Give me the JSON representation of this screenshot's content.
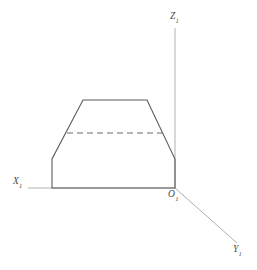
{
  "figure": {
    "canvas": {
      "width": 257,
      "height": 270
    },
    "background_color": "#ffffff",
    "axis_color": "#b0b0b0",
    "outline_color": "#5a5a5a",
    "dashed_color": "#6a6a6a"
  },
  "axes": {
    "z": {
      "name": "z-axis",
      "label_letter": "Z",
      "label_subscript": "1",
      "from": [
        175,
        188
      ],
      "to": [
        175,
        28
      ]
    },
    "x": {
      "name": "x-axis",
      "label_letter": "X",
      "label_subscript": "1",
      "from": [
        175,
        188
      ],
      "to": [
        28,
        188
      ]
    },
    "y": {
      "name": "y-axis",
      "label_letter": "Y",
      "label_subscript": "1",
      "from": [
        175,
        188
      ],
      "to": [
        237,
        243
      ]
    },
    "origin": {
      "name": "origin",
      "label_letter": "O",
      "label_subscript": "1",
      "point": [
        175,
        188
      ]
    }
  },
  "shapes": {
    "trapezoid_outline": {
      "name": "trapezoid-cross-section",
      "points": "52,188 52,159 83,100 147,100 175,159 175,188",
      "closed": true,
      "stroke": "#5a5a5a",
      "fill": "none"
    },
    "dashed_chord": {
      "name": "dashed-horizontal-chord",
      "from": [
        67,
        133
      ],
      "to": [
        163,
        133
      ],
      "stroke": "#6a6a6a",
      "dash": "6 4"
    }
  },
  "chart_data": {
    "type": "diagram",
    "xlabel": "X1",
    "ylabel": "Z1",
    "zlabel": "Y1",
    "grid": false,
    "legend": "none",
    "annotations": [
      {
        "text": "Z1",
        "x": 175,
        "y": 28
      },
      {
        "text": "X1",
        "x": 28,
        "y": 188
      },
      {
        "text": "O1",
        "x": 175,
        "y": 188
      },
      {
        "text": "Y1",
        "x": 237,
        "y": 243
      }
    ],
    "polylines": [
      {
        "name": "trapezoid-cross-section",
        "style": "solid",
        "points": [
          [
            52,
            188
          ],
          [
            52,
            159
          ],
          [
            83,
            100
          ],
          [
            147,
            100
          ],
          [
            175,
            159
          ],
          [
            175,
            188
          ],
          [
            52,
            188
          ]
        ]
      },
      {
        "name": "dashed-horizontal-chord",
        "style": "dashed",
        "points": [
          [
            67,
            133
          ],
          [
            163,
            133
          ]
        ]
      },
      {
        "name": "z-axis",
        "style": "solid-light",
        "points": [
          [
            175,
            188
          ],
          [
            175,
            28
          ]
        ]
      },
      {
        "name": "x-axis",
        "style": "solid-light",
        "points": [
          [
            175,
            188
          ],
          [
            28,
            188
          ]
        ]
      },
      {
        "name": "y-axis",
        "style": "solid-light",
        "points": [
          [
            175,
            188
          ],
          [
            237,
            243
          ]
        ]
      }
    ]
  }
}
